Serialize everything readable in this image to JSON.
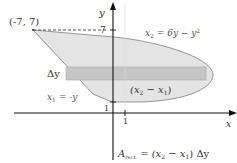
{
  "diagram": {
    "axes": {
      "x_label": "x",
      "y_label": "y"
    },
    "ticks": {
      "y7": "7",
      "y1": "1",
      "x1": "1"
    },
    "point_label": "(-7, 7)",
    "curve_right": {
      "lhs": "x",
      "sub": "2",
      "rhs": " = 6y − y",
      "sup": "2"
    },
    "curve_left": {
      "lhs": "x",
      "sub": "1",
      "rhs": " = -y"
    },
    "strip_width_label": "(x",
    "strip_width_sub2": "2",
    "strip_width_mid": " − x",
    "strip_width_sub1": "1",
    "strip_width_end": ")",
    "delta_y": "Δy",
    "area_formula": {
      "A": "A",
      "sub": "rect.",
      "rest1": " = (x",
      "sub2": "2",
      "rest2": " − x",
      "sub1": "1",
      "rest3": ") Δy"
    },
    "colors": {
      "region_fill": "#e4e4e4",
      "strip_fill": "#c8c8c8",
      "outline": "#8a8a8a",
      "axis": "#111111"
    }
  }
}
